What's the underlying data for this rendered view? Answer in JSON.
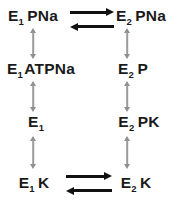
{
  "diagram": {
    "background_color": "#ffffff",
    "label_color": "#1a1a1a",
    "vertical_arrow_color": "#9a9a9a",
    "horizontal_arrow_color": "#111111",
    "columns": [
      {
        "name": "E1",
        "label": "E1 states (left column)"
      },
      {
        "name": "E2",
        "label": "E2 states (right column)"
      }
    ],
    "species": [
      {
        "id": "e1-pna",
        "base": "E",
        "subscript": "1",
        "ligand": "PNa",
        "column": "left",
        "row": 1
      },
      {
        "id": "e2-pna",
        "base": "E",
        "subscript": "2",
        "ligand": "PNa",
        "column": "right",
        "row": 1
      },
      {
        "id": "e1-atpna",
        "base": "E",
        "subscript": "1",
        "ligand": "ATPNa",
        "column": "left",
        "row": 2
      },
      {
        "id": "e2-p",
        "base": "E",
        "subscript": "2",
        "ligand": "P",
        "column": "right",
        "row": 2
      },
      {
        "id": "e1",
        "base": "E",
        "subscript": "1",
        "ligand": "",
        "column": "left",
        "row": 3
      },
      {
        "id": "e2-pk",
        "base": "E",
        "subscript": "2",
        "ligand": "PK",
        "column": "right",
        "row": 3
      },
      {
        "id": "e1-k",
        "base": "E",
        "subscript": "1",
        "ligand": "K",
        "column": "left",
        "row": 4
      },
      {
        "id": "e2-k",
        "base": "E",
        "subscript": "2",
        "ligand": "K",
        "column": "right",
        "row": 4
      }
    ],
    "vertical_arrows": [
      {
        "id": "v-left-1-2",
        "column": "left",
        "from": "e1-pna",
        "to": "e1-atpna",
        "style": "double-headed"
      },
      {
        "id": "v-left-2-3",
        "column": "left",
        "from": "e1-atpna",
        "to": "e1",
        "style": "double-headed"
      },
      {
        "id": "v-left-3-4",
        "column": "left",
        "from": "e1",
        "to": "e1-k",
        "style": "double-headed"
      },
      {
        "id": "v-right-1-2",
        "column": "right",
        "from": "e2-pna",
        "to": "e2-p",
        "style": "double-headed"
      },
      {
        "id": "v-right-2-3",
        "column": "right",
        "from": "e2-p",
        "to": "e2-pk",
        "style": "double-headed"
      },
      {
        "id": "v-right-3-4",
        "column": "right",
        "from": "e2-pk",
        "to": "e2-k",
        "style": "double-headed"
      }
    ],
    "horizontal_arrows": [
      {
        "id": "eq-top",
        "row": 1,
        "from": "e1-pna",
        "to": "e2-pna",
        "style": "equilibrium",
        "upper_direction": "right",
        "lower_direction": "left"
      },
      {
        "id": "eq-bottom",
        "row": 4,
        "from": "e1-k",
        "to": "e2-k",
        "style": "equilibrium",
        "upper_direction": "right",
        "lower_direction": "left"
      }
    ]
  }
}
